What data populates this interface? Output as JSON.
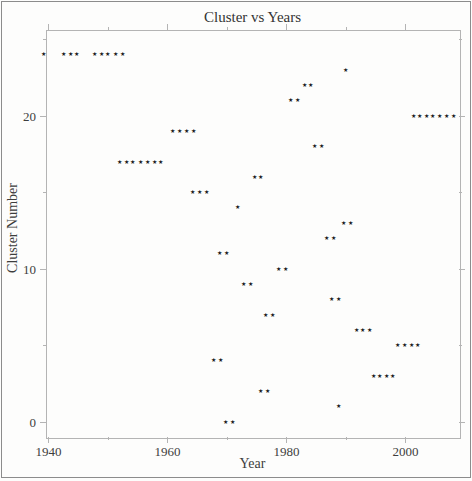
{
  "chart_data": {
    "type": "scatter",
    "title": "Cluster vs Years",
    "xlabel": "Year",
    "ylabel": "Cluster Number",
    "xlim": [
      1939.6,
      2009.0
    ],
    "ylim": [
      -1.0,
      25.6
    ],
    "grid": false,
    "legend": "none",
    "x_major_ticks": [
      1940,
      1960,
      1980,
      2000
    ],
    "x_minor_ticks": [
      1950,
      1970,
      1990
    ],
    "y_major_ticks": [
      0,
      10,
      20
    ],
    "y_minor_ticks": [
      5,
      15,
      25
    ],
    "marker": "star-icon",
    "marker_glyph": "★",
    "marker_color": "#1c1c1c",
    "frame_color": "#b4b4b4",
    "series": [
      {
        "cluster": 24,
        "years": [
          1939.2,
          1942.5,
          1943.7,
          1944.8,
          1947.7,
          1948.9,
          1950.0,
          1951.2,
          1952.4
        ]
      },
      {
        "cluster": 23,
        "years": [
          1989.9
        ]
      },
      {
        "cluster": 22,
        "years": [
          1983.0,
          1984.1
        ]
      },
      {
        "cluster": 21,
        "years": [
          1980.7,
          1981.9
        ]
      },
      {
        "cluster": 20,
        "years": [
          2001.3,
          2002.4,
          2003.5,
          2004.6,
          2005.7,
          2006.9,
          2008.0
        ]
      },
      {
        "cluster": 19,
        "years": [
          1960.8,
          1962.0,
          1963.2,
          1964.4
        ]
      },
      {
        "cluster": 18,
        "years": [
          1984.8,
          1985.9
        ]
      },
      {
        "cluster": 17,
        "years": [
          1951.9,
          1953.1,
          1954.2,
          1955.4,
          1956.6,
          1957.8,
          1958.9
        ]
      },
      {
        "cluster": 16,
        "years": [
          1974.6,
          1975.7
        ]
      },
      {
        "cluster": 15,
        "years": [
          1964.2,
          1965.4,
          1966.6
        ]
      },
      {
        "cluster": 14,
        "years": [
          1971.8
        ]
      },
      {
        "cluster": 13,
        "years": [
          1989.6,
          1990.7
        ]
      },
      {
        "cluster": 12,
        "years": [
          1986.8,
          1987.9
        ]
      },
      {
        "cluster": 11,
        "years": [
          1968.7,
          1969.9
        ]
      },
      {
        "cluster": 10,
        "years": [
          1978.7,
          1979.8
        ]
      },
      {
        "cluster": 9,
        "years": [
          1972.8,
          1973.9
        ]
      },
      {
        "cluster": 8,
        "years": [
          1987.6,
          1988.7
        ]
      },
      {
        "cluster": 7,
        "years": [
          1976.5,
          1977.7
        ]
      },
      {
        "cluster": 6,
        "years": [
          1991.7,
          1992.8,
          1994.0
        ]
      },
      {
        "cluster": 5,
        "years": [
          1998.7,
          1999.8,
          2001.0,
          2002.1
        ]
      },
      {
        "cluster": 4,
        "years": [
          1967.7,
          1968.9
        ]
      },
      {
        "cluster": 3,
        "years": [
          1994.6,
          1995.6,
          1996.8,
          1997.8
        ]
      },
      {
        "cluster": 2,
        "years": [
          1975.7,
          1976.9
        ]
      },
      {
        "cluster": 1,
        "years": [
          1988.8
        ]
      },
      {
        "cluster": 0,
        "years": [
          1969.8,
          1970.9
        ]
      }
    ]
  },
  "layout": {
    "plot_box": {
      "left": 46,
      "top": 30,
      "width": 413,
      "height": 407
    },
    "major_tick_len": 6,
    "minor_tick_len": 3
  }
}
